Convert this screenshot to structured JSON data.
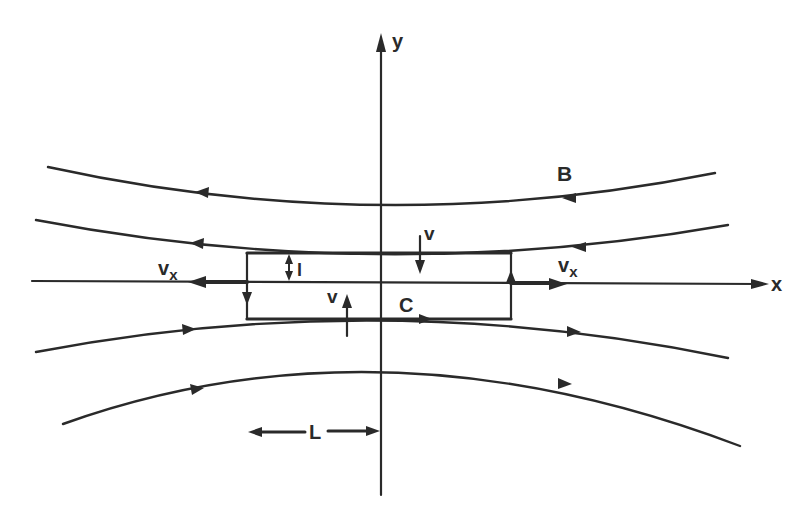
{
  "figure": {
    "axes": {
      "x_label": "x",
      "y_label": "y"
    },
    "labels": {
      "field": "B",
      "contour": "C",
      "inflow_top": "v",
      "inflow_bottom": "v",
      "outflow_left": "v",
      "outflow_left_sub": "x",
      "outflow_right": "v",
      "outflow_right_sub": "x",
      "half_thickness": "l",
      "half_length": "L"
    },
    "field_lines": [
      {
        "name": "field-line-1",
        "direction": "right-to-left"
      },
      {
        "name": "field-line-2",
        "direction": "right-to-left"
      },
      {
        "name": "field-line-3",
        "direction": "left-to-right"
      },
      {
        "name": "field-line-4",
        "direction": "left-to-right"
      }
    ],
    "contour_direction": "counterclockwise (bottom edge rightwards, right edge upwards, top edge leftwards, left edge downwards)",
    "colors": {
      "ink": "#2a2a2a",
      "background": "#ffffff"
    }
  }
}
